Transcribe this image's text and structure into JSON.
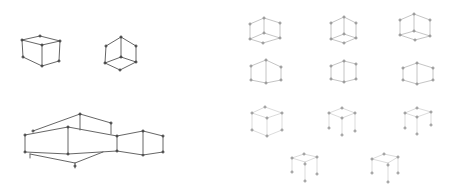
{
  "canvas": {
    "width": 454,
    "height": 196,
    "background": "#ffffff"
  },
  "style": {
    "dark_stroke": "#555555",
    "light_stroke": "#b5b5b5",
    "faint_stroke": "#d2d2d2",
    "dark_vertex": "#333333",
    "light_vertex": "#888888"
  },
  "figures": [
    {
      "name": "cube-left-top",
      "tone": "dark",
      "width": 0.9,
      "edges": [
        [
          22,
          40,
          40,
          36
        ],
        [
          40,
          36,
          60,
          41
        ],
        [
          22,
          40,
          42,
          45
        ],
        [
          42,
          45,
          60,
          41
        ],
        [
          22,
          40,
          23,
          57
        ],
        [
          42,
          45,
          42,
          66
        ],
        [
          60,
          41,
          59,
          61
        ],
        [
          23,
          57,
          42,
          66
        ],
        [
          42,
          66,
          59,
          61
        ]
      ],
      "vertices": [
        [
          22,
          40
        ],
        [
          40,
          36
        ],
        [
          60,
          41
        ],
        [
          42,
          45
        ],
        [
          23,
          57
        ],
        [
          42,
          66
        ],
        [
          59,
          61
        ]
      ]
    },
    {
      "name": "cube-mid-top",
      "tone": "dark",
      "width": 0.9,
      "edges": [
        [
          106,
          46,
          121,
          37
        ],
        [
          121,
          37,
          136,
          46
        ],
        [
          106,
          46,
          105,
          63
        ],
        [
          121,
          37,
          121,
          57
        ],
        [
          136,
          46,
          136,
          62
        ],
        [
          105,
          63,
          121,
          57
        ],
        [
          121,
          57,
          136,
          62
        ],
        [
          105,
          63,
          120,
          70
        ],
        [
          120,
          70,
          136,
          62
        ]
      ],
      "vertices": [
        [
          106,
          46
        ],
        [
          121,
          37
        ],
        [
          136,
          46
        ],
        [
          105,
          63
        ],
        [
          121,
          57
        ],
        [
          136,
          62
        ],
        [
          120,
          70
        ]
      ]
    },
    {
      "name": "building-bottom-left",
      "tone": "dark",
      "width": 0.9,
      "edges": [
        [
          33,
          131,
          80,
          114
        ],
        [
          80,
          114,
          111,
          123
        ],
        [
          111,
          123,
          111,
          134
        ],
        [
          80,
          114,
          80,
          130
        ],
        [
          25,
          135,
          68,
          127
        ],
        [
          68,
          127,
          117,
          136
        ],
        [
          117,
          136,
          143,
          131
        ],
        [
          143,
          131,
          163,
          136
        ],
        [
          25,
          135,
          25,
          152
        ],
        [
          68,
          127,
          68,
          154
        ],
        [
          117,
          136,
          117,
          151
        ],
        [
          143,
          131,
          143,
          153
        ],
        [
          163,
          136,
          163,
          152
        ],
        [
          25,
          152,
          68,
          154
        ],
        [
          68,
          154,
          117,
          151
        ],
        [
          117,
          151,
          143,
          155
        ],
        [
          143,
          155,
          163,
          152
        ],
        [
          30,
          154,
          75,
          163
        ],
        [
          75,
          163,
          103,
          152
        ],
        [
          75,
          163,
          75,
          168
        ],
        [
          30,
          154,
          30,
          158
        ]
      ],
      "vertices": [
        [
          33,
          131
        ],
        [
          80,
          114
        ],
        [
          111,
          123
        ],
        [
          25,
          135
        ],
        [
          68,
          127
        ],
        [
          117,
          136
        ],
        [
          143,
          131
        ],
        [
          163,
          136
        ],
        [
          25,
          152
        ],
        [
          68,
          154
        ],
        [
          117,
          151
        ],
        [
          143,
          155
        ],
        [
          163,
          152
        ],
        [
          75,
          166
        ]
      ]
    },
    {
      "name": "cube-r1c1",
      "tone": "light",
      "width": 0.8,
      "edges": [
        [
          250,
          24,
          264,
          18
        ],
        [
          264,
          18,
          280,
          23
        ],
        [
          250,
          24,
          250,
          39
        ],
        [
          264,
          18,
          264,
          33
        ],
        [
          280,
          23,
          280,
          38
        ],
        [
          250,
          39,
          264,
          33
        ],
        [
          264,
          33,
          280,
          38
        ],
        [
          250,
          39,
          263,
          43
        ],
        [
          263,
          43,
          280,
          38
        ]
      ],
      "vertices": [
        [
          250,
          24
        ],
        [
          264,
          18
        ],
        [
          280,
          23
        ],
        [
          250,
          39
        ],
        [
          264,
          33
        ],
        [
          280,
          38
        ],
        [
          263,
          43
        ]
      ]
    },
    {
      "name": "cube-r1c2",
      "tone": "light",
      "width": 0.8,
      "edges": [
        [
          331,
          23,
          344,
          17
        ],
        [
          344,
          17,
          356,
          23
        ],
        [
          331,
          23,
          331,
          39
        ],
        [
          344,
          17,
          344,
          34
        ],
        [
          356,
          23,
          356,
          38
        ],
        [
          331,
          39,
          344,
          34
        ],
        [
          344,
          34,
          356,
          38
        ],
        [
          331,
          39,
          344,
          43
        ],
        [
          344,
          43,
          356,
          38
        ]
      ],
      "vertices": [
        [
          331,
          23
        ],
        [
          344,
          17
        ],
        [
          356,
          23
        ],
        [
          331,
          39
        ],
        [
          344,
          34
        ],
        [
          356,
          38
        ],
        [
          344,
          43
        ]
      ]
    },
    {
      "name": "cube-r1c3",
      "tone": "light",
      "width": 0.8,
      "edges": [
        [
          400,
          20,
          414,
          14
        ],
        [
          414,
          14,
          430,
          20
        ],
        [
          400,
          20,
          400,
          35
        ],
        [
          414,
          14,
          414,
          31
        ],
        [
          430,
          20,
          430,
          36
        ],
        [
          400,
          35,
          414,
          31
        ],
        [
          414,
          31,
          430,
          36
        ],
        [
          400,
          35,
          415,
          40
        ],
        [
          415,
          40,
          430,
          36
        ]
      ],
      "vertices": [
        [
          400,
          20
        ],
        [
          414,
          14
        ],
        [
          430,
          20
        ],
        [
          400,
          35
        ],
        [
          414,
          31
        ],
        [
          430,
          36
        ],
        [
          415,
          40
        ]
      ]
    },
    {
      "name": "cube-r2c1",
      "tone": "light",
      "width": 0.8,
      "edges": [
        [
          251,
          66,
          266,
          60
        ],
        [
          266,
          60,
          281,
          67
        ],
        [
          251,
          66,
          251,
          80
        ],
        [
          266,
          60,
          266,
          83
        ],
        [
          281,
          67,
          281,
          80
        ],
        [
          251,
          80,
          266,
          83
        ],
        [
          266,
          83,
          281,
          80
        ]
      ],
      "vertices": [
        [
          251,
          66
        ],
        [
          266,
          60
        ],
        [
          281,
          67
        ],
        [
          251,
          80
        ],
        [
          266,
          83
        ],
        [
          281,
          80
        ]
      ]
    },
    {
      "name": "cube-r2c2",
      "tone": "light",
      "width": 0.8,
      "edges": [
        [
          331,
          66,
          344,
          61
        ],
        [
          344,
          61,
          356,
          64
        ],
        [
          331,
          66,
          331,
          79
        ],
        [
          344,
          61,
          344,
          82
        ],
        [
          356,
          64,
          356,
          79
        ],
        [
          331,
          79,
          344,
          82
        ],
        [
          344,
          82,
          356,
          79
        ]
      ],
      "vertices": [
        [
          331,
          66
        ],
        [
          344,
          61
        ],
        [
          356,
          64
        ],
        [
          331,
          79
        ],
        [
          344,
          82
        ],
        [
          356,
          79
        ]
      ]
    },
    {
      "name": "cube-r2c3",
      "tone": "light",
      "width": 0.8,
      "edges": [
        [
          403,
          68,
          417,
          63
        ],
        [
          417,
          63,
          433,
          68
        ],
        [
          403,
          68,
          403,
          80
        ],
        [
          417,
          63,
          417,
          84
        ],
        [
          433,
          68,
          433,
          80
        ],
        [
          403,
          80,
          417,
          84
        ],
        [
          417,
          84,
          433,
          80
        ]
      ],
      "vertices": [
        [
          403,
          68
        ],
        [
          417,
          63
        ],
        [
          433,
          68
        ],
        [
          403,
          80
        ],
        [
          417,
          84
        ],
        [
          433,
          80
        ]
      ]
    },
    {
      "name": "cube-r3c1",
      "tone": "faint",
      "width": 0.8,
      "edges": [
        [
          252,
          113,
          265,
          107
        ],
        [
          265,
          107,
          282,
          113
        ],
        [
          252,
          113,
          267,
          118
        ],
        [
          267,
          118,
          282,
          113
        ],
        [
          252,
          113,
          252,
          130
        ],
        [
          267,
          118,
          267,
          136
        ],
        [
          282,
          113,
          282,
          130
        ],
        [
          252,
          130,
          267,
          136
        ],
        [
          267,
          136,
          282,
          130
        ]
      ],
      "vertices": [
        [
          252,
          113
        ],
        [
          265,
          107
        ],
        [
          282,
          113
        ],
        [
          267,
          118
        ],
        [
          252,
          130
        ],
        [
          267,
          136
        ],
        [
          282,
          130
        ]
      ]
    },
    {
      "name": "cube-r3c2",
      "tone": "faint",
      "width": 0.8,
      "edges": [
        [
          329,
          113,
          342,
          108
        ],
        [
          342,
          108,
          355,
          113
        ],
        [
          329,
          113,
          342,
          118
        ],
        [
          342,
          118,
          355,
          113
        ],
        [
          329,
          113,
          329,
          128
        ],
        [
          342,
          118,
          342,
          135
        ],
        [
          355,
          113,
          355,
          131
        ]
      ],
      "vertices": [
        [
          329,
          113
        ],
        [
          342,
          108
        ],
        [
          355,
          113
        ],
        [
          342,
          118
        ],
        [
          329,
          128
        ],
        [
          342,
          135
        ],
        [
          355,
          131
        ]
      ]
    },
    {
      "name": "cube-r3c3",
      "tone": "faint",
      "width": 0.8,
      "edges": [
        [
          405,
          113,
          417,
          108
        ],
        [
          417,
          108,
          431,
          112
        ],
        [
          405,
          113,
          417,
          117
        ],
        [
          417,
          117,
          431,
          112
        ],
        [
          405,
          113,
          405,
          128
        ],
        [
          417,
          117,
          417,
          134
        ],
        [
          431,
          112,
          431,
          125
        ]
      ],
      "vertices": [
        [
          405,
          113
        ],
        [
          417,
          108
        ],
        [
          431,
          112
        ],
        [
          417,
          117
        ],
        [
          405,
          128
        ],
        [
          417,
          134
        ],
        [
          431,
          125
        ]
      ]
    },
    {
      "name": "cube-r4c1",
      "tone": "faint",
      "width": 0.8,
      "edges": [
        [
          292,
          158,
          304,
          154
        ],
        [
          304,
          154,
          317,
          157
        ],
        [
          292,
          158,
          305,
          162
        ],
        [
          305,
          162,
          317,
          157
        ],
        [
          292,
          158,
          292,
          172
        ],
        [
          305,
          162,
          305,
          181
        ],
        [
          317,
          157,
          317,
          174
        ]
      ],
      "vertices": [
        [
          292,
          158
        ],
        [
          304,
          154
        ],
        [
          317,
          157
        ],
        [
          305,
          164
        ],
        [
          292,
          172
        ],
        [
          305,
          181
        ],
        [
          317,
          174
        ]
      ]
    },
    {
      "name": "cube-r4c2",
      "tone": "faint",
      "width": 0.8,
      "edges": [
        [
          372,
          159,
          384,
          154
        ],
        [
          384,
          154,
          398,
          157
        ],
        [
          372,
          159,
          388,
          163
        ],
        [
          388,
          163,
          398,
          157
        ],
        [
          372,
          159,
          372,
          173
        ],
        [
          388,
          163,
          388,
          182
        ],
        [
          398,
          157,
          398,
          173
        ]
      ],
      "vertices": [
        [
          372,
          159
        ],
        [
          384,
          154
        ],
        [
          398,
          157
        ],
        [
          388,
          165
        ],
        [
          372,
          173
        ],
        [
          388,
          182
        ],
        [
          398,
          173
        ]
      ]
    }
  ]
}
